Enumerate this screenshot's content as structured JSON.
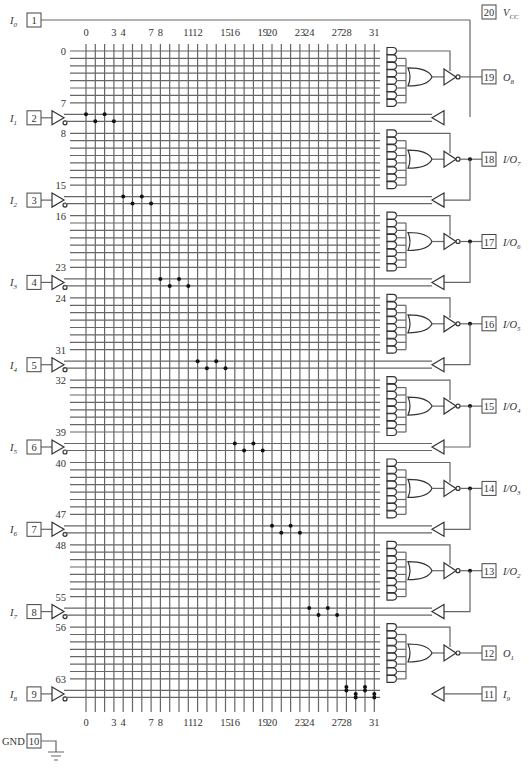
{
  "device": {
    "type": "PAL16L8-style programmable logic array",
    "column_count": 32,
    "product_line_count": 64
  },
  "column_labels": [
    "0",
    "3",
    "4",
    "7",
    "8",
    "11",
    "12",
    "15",
    "16",
    "19",
    "20",
    "23",
    "24",
    "27",
    "28",
    "31"
  ],
  "column_label_indices": [
    0,
    3,
    4,
    7,
    8,
    11,
    12,
    15,
    16,
    19,
    20,
    23,
    24,
    27,
    28,
    31
  ],
  "row_labels": [
    "0",
    "7",
    "8",
    "15",
    "16",
    "23",
    "24",
    "31",
    "32",
    "39",
    "40",
    "47",
    "48",
    "55",
    "56",
    "63"
  ],
  "left_pins": [
    {
      "pin": "1",
      "name": "I",
      "sub": "0"
    },
    {
      "pin": "2",
      "name": "I",
      "sub": "1"
    },
    {
      "pin": "3",
      "name": "I",
      "sub": "2"
    },
    {
      "pin": "4",
      "name": "I",
      "sub": "3"
    },
    {
      "pin": "5",
      "name": "I",
      "sub": "4"
    },
    {
      "pin": "6",
      "name": "I",
      "sub": "5"
    },
    {
      "pin": "7",
      "name": "I",
      "sub": "6"
    },
    {
      "pin": "8",
      "name": "I",
      "sub": "7"
    },
    {
      "pin": "9",
      "name": "I",
      "sub": "8"
    },
    {
      "pin": "10",
      "name": "GND",
      "sub": ""
    }
  ],
  "right_pins": [
    {
      "pin": "20",
      "name": "V",
      "sub": "CC"
    },
    {
      "pin": "19",
      "name": "O",
      "sub": "8"
    },
    {
      "pin": "18",
      "name": "I/O",
      "sub": "7"
    },
    {
      "pin": "17",
      "name": "I/O",
      "sub": "6"
    },
    {
      "pin": "16",
      "name": "I/O",
      "sub": "5"
    },
    {
      "pin": "15",
      "name": "I/O",
      "sub": "4"
    },
    {
      "pin": "14",
      "name": "I/O",
      "sub": "3"
    },
    {
      "pin": "13",
      "name": "I/O",
      "sub": "2"
    },
    {
      "pin": "12",
      "name": "O",
      "sub": "1"
    },
    {
      "pin": "11",
      "name": "I",
      "sub": "9"
    }
  ]
}
